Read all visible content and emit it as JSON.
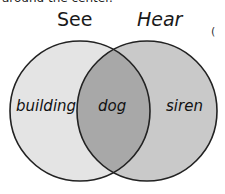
{
  "header": {
    "clipped_text": "around the center."
  },
  "sets": [
    {
      "title": "See",
      "fill": "#e4e4e4"
    },
    {
      "title": "Hear",
      "fill": "#c9c9c9"
    }
  ],
  "regions": {
    "left_only": "building",
    "intersection": "dog",
    "right_only": "siren"
  },
  "colors": {
    "intersection": "#a8a8a8",
    "stroke": "#222222"
  },
  "edge_glyph": "("
}
